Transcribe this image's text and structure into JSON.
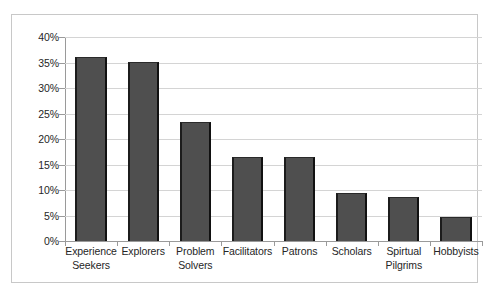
{
  "chart_data": {
    "type": "bar",
    "title": "",
    "subtitle": "",
    "xlabel": "",
    "ylabel": "",
    "ylim": [
      0,
      40
    ],
    "ytick_values": [
      0,
      5,
      10,
      15,
      20,
      25,
      30,
      35,
      40
    ],
    "ytick_labels": [
      "0%",
      "5%",
      "10%",
      "15%",
      "20%",
      "25%",
      "30%",
      "35%",
      "40%"
    ],
    "grid": true,
    "legend": false,
    "legend_position": "none",
    "categories": [
      "Experience Seekers",
      "Explorers",
      "Problem Solvers",
      "Facilitators",
      "Patrons",
      "Scholars",
      "Spirtual Pilgrims",
      "Hobbyists"
    ],
    "category_lines": [
      [
        "Experience",
        "Seekers"
      ],
      [
        "Explorers"
      ],
      [
        "Problem",
        "Solvers"
      ],
      [
        "Facilitators"
      ],
      [
        "Patrons"
      ],
      [
        "Scholars"
      ],
      [
        "Spirtual",
        "Pilgrims"
      ],
      [
        "Hobbyists"
      ]
    ],
    "values": [
      36.0,
      35.1,
      23.3,
      16.4,
      16.4,
      9.5,
      8.6,
      4.8
    ],
    "bar_color": "#4f4f4f",
    "bar_edge_color": "#1c1c1c",
    "grid_color": "#d4d4d4",
    "axis_color": "#9a9a9a",
    "text_color": "#262626",
    "background_color": "#ffffff",
    "border_color": "#c8c8c8"
  }
}
